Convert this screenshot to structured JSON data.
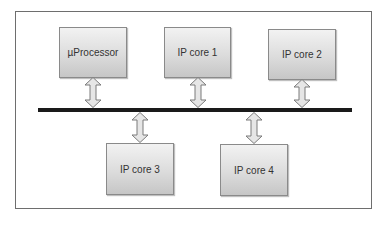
{
  "diagram": {
    "type": "bus-architecture",
    "bus": {
      "label": "",
      "color": "#1a1a1a"
    },
    "blocks": [
      {
        "id": "uprocessor",
        "label": "µProcessor",
        "position": "top"
      },
      {
        "id": "ipcore1",
        "label": "IP core 1",
        "position": "top"
      },
      {
        "id": "ipcore2",
        "label": "IP core 2",
        "position": "top"
      },
      {
        "id": "ipcore3",
        "label": "IP core 3",
        "position": "bottom"
      },
      {
        "id": "ipcore4",
        "label": "IP core 4",
        "position": "bottom"
      }
    ],
    "connections": [
      {
        "from": "uprocessor",
        "to": "bus",
        "direction": "bidirectional"
      },
      {
        "from": "ipcore1",
        "to": "bus",
        "direction": "bidirectional"
      },
      {
        "from": "ipcore2",
        "to": "bus",
        "direction": "bidirectional"
      },
      {
        "from": "ipcore3",
        "to": "bus",
        "direction": "bidirectional"
      },
      {
        "from": "ipcore4",
        "to": "bus",
        "direction": "bidirectional"
      }
    ],
    "colors": {
      "box_fill_top": "#f2f2f2",
      "box_fill_bottom": "#c6c6c6",
      "box_border": "#8a8a8a",
      "arrow_fill": "#e6e6e6",
      "arrow_stroke": "#7a7a7a",
      "frame_border": "#6e6e6e"
    }
  }
}
